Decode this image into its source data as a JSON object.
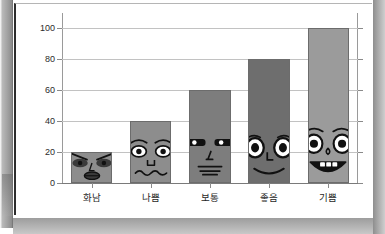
{
  "chart_data": {
    "type": "bar",
    "title": "",
    "subtitle": "",
    "xlabel": "",
    "ylabel": "",
    "categories": [
      "화남",
      "나쁨",
      "보통",
      "좋음",
      "기쁨"
    ],
    "values": [
      20,
      40,
      60,
      80,
      100
    ],
    "series": [
      {
        "name": "감정 수준",
        "values": [
          20,
          40,
          60,
          80,
          100
        ]
      }
    ],
    "ylim": [
      0,
      110
    ],
    "yticks": [
      0,
      20,
      40,
      60,
      80,
      100
    ],
    "ytick_labels": [
      "0",
      "20",
      "40",
      "60",
      "80",
      "100"
    ],
    "grid": true,
    "grid_axis": "y",
    "legend": false,
    "legend_position": "none",
    "annotations": [
      {
        "category": "화남",
        "value": 20,
        "face": "angry-face",
        "description": "성난 눈썹과 다문 입"
      },
      {
        "category": "나쁨",
        "value": 40,
        "face": "sad-face",
        "description": "처진 눈썹과 물결 입"
      },
      {
        "category": "보통",
        "value": 60,
        "face": "neutral-face",
        "description": "가는 눈과 일자 입"
      },
      {
        "category": "좋음",
        "value": 80,
        "face": "happy-face",
        "description": "큰 눈과 웃는 입"
      },
      {
        "category": "기쁨",
        "value": 100,
        "face": "joyful-face",
        "description": "활짝 웃는 입과 이"
      }
    ],
    "bar_colors": [
      "#8d8d8d",
      "#8d8d8d",
      "#7d7d7d",
      "#6e6e6e",
      "#9b9b9b"
    ]
  },
  "chart": {
    "bars": [
      {
        "category": "화남",
        "value": 20,
        "face": "angry-face",
        "color": "#8d8d8d"
      },
      {
        "category": "나쁨",
        "value": 40,
        "face": "sad-face",
        "color": "#8d8d8d"
      },
      {
        "category": "보통",
        "value": 60,
        "face": "neutral-face",
        "color": "#7d7d7d"
      },
      {
        "category": "좋음",
        "value": 80,
        "face": "happy-face",
        "color": "#6e6e6e"
      },
      {
        "category": "기쁨",
        "value": 100,
        "face": "joyful-face",
        "color": "#9b9b9b"
      }
    ],
    "yticks": [
      "100",
      "80",
      "60",
      "40",
      "20",
      "0"
    ],
    "axis_color": "#9a9a9a",
    "grid_color": "#c2c2c2",
    "background": "#ffffff"
  }
}
